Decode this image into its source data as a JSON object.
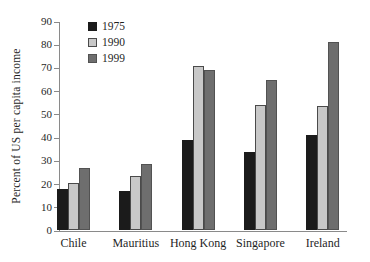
{
  "chart_data": {
    "type": "bar",
    "ylabel": "Percent of US per capita income",
    "xlabel": "",
    "categories": [
      "Chile",
      "Mauritius",
      "Hong Kong",
      "Singapore",
      "Ireland"
    ],
    "series": [
      {
        "name": "1975",
        "color": "#1b1b1b",
        "border": "#1b1b1b",
        "values": [
          18,
          17,
          39,
          34,
          41
        ]
      },
      {
        "name": "1990",
        "color": "#c8c8c8",
        "border": "#4a4a4a",
        "values": [
          20.5,
          23.5,
          71,
          54,
          53.5
        ]
      },
      {
        "name": "1999",
        "color": "#6e6e6e",
        "border": "#525252",
        "values": [
          27,
          28.5,
          69,
          65,
          81
        ]
      }
    ],
    "ylim": [
      0,
      90
    ],
    "yticks": [
      "0",
      "10",
      "20",
      "30",
      "40",
      "50",
      "60",
      "70",
      "80",
      "90"
    ],
    "grid": false,
    "legend_position": "top-left-inside",
    "axis_color": "#8a8a8a",
    "text_color": "#1f1f1f",
    "background_color": "#ffffff"
  }
}
